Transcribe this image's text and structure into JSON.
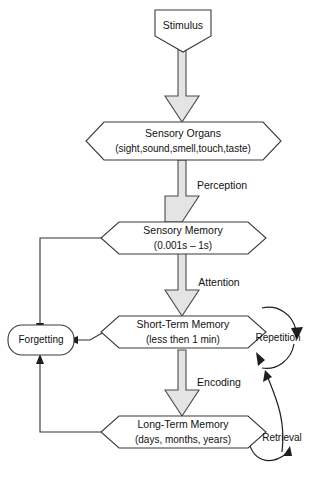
{
  "diagram": {
    "background_color": "#ffffff",
    "arrow_fill_color": "#e4e4e4",
    "arrow_stroke_color": "#4a4a4a",
    "node_stroke_color": "#3a3a3a",
    "text_color": "#111111"
  },
  "nodes": {
    "stimulus": {
      "label": "Stimulus",
      "shape": "pentagon"
    },
    "sensory_organs": {
      "label": "Sensory Organs",
      "sublabel": "(sight,sound,smell,touch,taste)",
      "shape": "hexagon"
    },
    "sensory_memory": {
      "label": "Sensory Memory",
      "sublabel": "(0.001s – 1s)",
      "shape": "hexagon"
    },
    "short_term_memory": {
      "label": "Short-Term Memory",
      "sublabel": "(less then 1 min)",
      "shape": "hexagon"
    },
    "long_term_memory": {
      "label": "Long-Term Memory",
      "sublabel": "(days, months, years)",
      "shape": "hexagon"
    },
    "forgetting": {
      "label": "Forgetting",
      "shape": "rounded-rectangle"
    },
    "repetition": {
      "label": "Repetition",
      "shape": "text-with-loop-arrow"
    },
    "retrieval": {
      "label": "Retrieval",
      "shape": "text-with-curved-arrow"
    }
  },
  "edge_labels": {
    "perception": "Perception",
    "attention": "Attention",
    "encoding": "Encoding"
  },
  "flow_sequence": [
    "Stimulus",
    "Sensory Organs",
    "Sensory Memory",
    "Short-Term Memory",
    "Long-Term Memory"
  ]
}
